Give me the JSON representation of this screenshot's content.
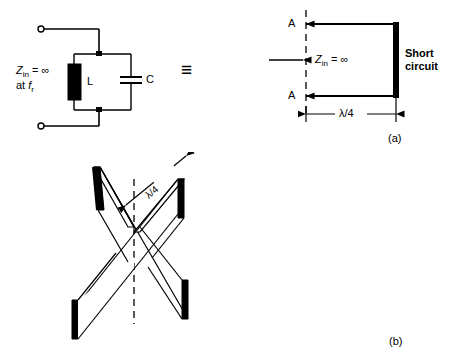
{
  "figure": {
    "caption_a": "(a)",
    "caption_b": "(b)",
    "equivalence_symbol": "≡"
  },
  "circuit_a": {
    "impedance_line1_main": "Z",
    "impedance_line1_sub": "in",
    "impedance_line1_rest": "= ∞",
    "impedance_line2_main": "at ",
    "impedance_line2_ital": "f",
    "impedance_line2_sub": "r",
    "inductor_label": "L",
    "capacitor_label": "C",
    "terminal_top": "open-terminal",
    "terminal_bottom": "open-terminal"
  },
  "stub_a": {
    "ref_top": "A",
    "ref_bottom": "A",
    "zin_main": "Z",
    "zin_sub": "in",
    "zin_rest": "= ∞",
    "short_circuit_line1": "Short",
    "short_circuit_line2": "circuit",
    "length_label": "λ/4"
  },
  "crossed_b": {
    "length_label": "λ/4",
    "arm_count": 4,
    "description": "crossed quarter-wave shorted stubs"
  },
  "colors": {
    "line": "#000000",
    "fill_black": "#000000",
    "background": "#ffffff"
  }
}
